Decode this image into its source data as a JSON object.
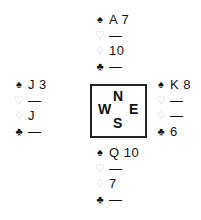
{
  "suits": {
    "spade": "♠",
    "heart": "♡",
    "diamond": "♢",
    "club": "♣"
  },
  "hands": {
    "north": {
      "spades": "A 7",
      "hearts": "—",
      "diamonds": "10",
      "clubs": "—"
    },
    "west": {
      "spades": "J 3",
      "hearts": "—",
      "diamonds": "J",
      "clubs": "—"
    },
    "east": {
      "spades": "K 8",
      "hearts": "—",
      "diamonds": "—",
      "clubs": "6"
    },
    "south": {
      "spades": "Q 10",
      "hearts": "—",
      "diamonds": "7",
      "clubs": "—"
    }
  },
  "compass": {
    "north": "N",
    "west": "W",
    "east": "E",
    "south": "S"
  }
}
